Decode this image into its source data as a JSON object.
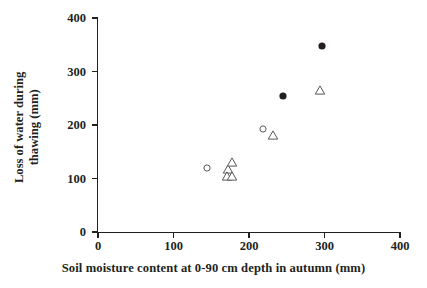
{
  "chart_data": {
    "type": "scatter",
    "title": "",
    "xlabel": "Soil moisture content at 0-90 cm depth in autumn (mm)",
    "ylabel_lines": [
      "Loss of water during",
      "thawing (mm)"
    ],
    "ylabel": "Loss of water during thawing (mm)",
    "xlim": [
      0,
      400
    ],
    "ylim": [
      0,
      400
    ],
    "xticks": [
      0,
      100,
      200,
      300,
      400
    ],
    "yticks": [
      0,
      100,
      200,
      300,
      400
    ],
    "xtick_labels": [
      "0",
      "100",
      "200",
      "300",
      "400"
    ],
    "ytick_labels": [
      "0",
      "100",
      "200",
      "300",
      "400"
    ],
    "grid": false,
    "legend": false,
    "series": [
      {
        "name": "filled-circle",
        "marker": "filled-circle",
        "points": [
          {
            "x": 245,
            "y": 255
          },
          {
            "x": 297,
            "y": 347
          }
        ]
      },
      {
        "name": "open-circle",
        "marker": "open-circle",
        "points": [
          {
            "x": 144,
            "y": 120
          },
          {
            "x": 218,
            "y": 192
          }
        ]
      },
      {
        "name": "open-triangle",
        "marker": "open-triangle",
        "points": [
          {
            "x": 172,
            "y": 117
          },
          {
            "x": 177,
            "y": 130
          },
          {
            "x": 171,
            "y": 105
          },
          {
            "x": 177,
            "y": 104
          },
          {
            "x": 232,
            "y": 182
          },
          {
            "x": 294,
            "y": 265
          }
        ]
      }
    ]
  }
}
